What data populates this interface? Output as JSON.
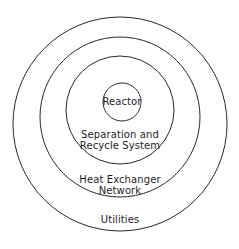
{
  "diagram": {
    "type": "onion",
    "layers": [
      {
        "id": "reactor",
        "label": "Reactor",
        "cx": 122,
        "cy": 102,
        "r": 19
      },
      {
        "id": "separation",
        "label_lines": [
          "Separation and",
          "Recycle System"
        ],
        "cx": 120,
        "cy": 110,
        "r": 54
      },
      {
        "id": "heat_exchanger",
        "label_lines": [
          "Heat Exchanger",
          "Network"
        ],
        "cx": 120,
        "cy": 117,
        "r": 81
      },
      {
        "id": "utilities",
        "label": "Utilities",
        "cx": 120,
        "cy": 124,
        "r": 107
      }
    ],
    "stroke_color": "#2a2a2a"
  }
}
